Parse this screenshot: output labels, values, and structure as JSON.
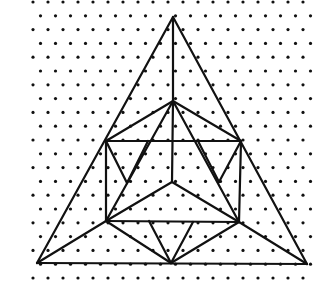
{
  "figure": {
    "grid": {
      "dx": 15,
      "dy": 13.8,
      "x0": 33,
      "y0": 2,
      "row_offset": 7.5,
      "x_min": 26,
      "x_max": 316,
      "y_min": 0,
      "y_max": 282,
      "dot_radius": 1.6
    },
    "vertices": {
      "A": [
        173,
        17
      ],
      "B": [
        37,
        263
      ],
      "C": [
        307,
        264
      ],
      "T": [
        173,
        101
      ],
      "HL": [
        106,
        141
      ],
      "HR": [
        241,
        141
      ],
      "LL": [
        106,
        221
      ],
      "LR": [
        239,
        222
      ],
      "O": [
        172,
        182
      ],
      "M": [
        171,
        263
      ],
      "P1": [
        148,
        141
      ],
      "P2": [
        198,
        141
      ],
      "Q1": [
        127,
        183
      ],
      "Q2": [
        219,
        182
      ],
      "R1": [
        149,
        221
      ],
      "R2": [
        193,
        222
      ]
    },
    "edges": [
      [
        "A",
        "B"
      ],
      [
        "A",
        "C"
      ],
      [
        "B",
        "C"
      ],
      [
        "A",
        "T"
      ],
      [
        "T",
        "O"
      ],
      [
        "T",
        "HL"
      ],
      [
        "T",
        "HR"
      ],
      [
        "HL",
        "HR"
      ],
      [
        "HL",
        "LL"
      ],
      [
        "HR",
        "LR"
      ],
      [
        "LL",
        "LR"
      ],
      [
        "T",
        "LL"
      ],
      [
        "T",
        "LR"
      ],
      [
        "O",
        "LL"
      ],
      [
        "O",
        "LR"
      ],
      [
        "B",
        "LL"
      ],
      [
        "C",
        "LR"
      ],
      [
        "LL",
        "M"
      ],
      [
        "LR",
        "M"
      ],
      [
        "HL",
        "Q1"
      ],
      [
        "P1",
        "Q1"
      ],
      [
        "HR",
        "Q2"
      ],
      [
        "P2",
        "Q2"
      ],
      [
        "R1",
        "M"
      ],
      [
        "R2",
        "M"
      ]
    ]
  }
}
